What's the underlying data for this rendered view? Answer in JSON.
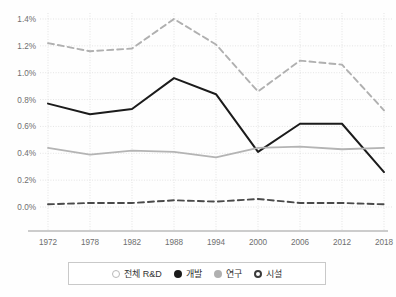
{
  "chart_data": {
    "type": "line",
    "title": "",
    "subtitle": "",
    "xlabel": "",
    "ylabel": "",
    "grid": true,
    "legend_position": "bottom",
    "categories": [
      "1972",
      "1978",
      "1982",
      "1988",
      "1994",
      "2000",
      "2006",
      "2012",
      "2018"
    ],
    "x": [
      1972,
      1978,
      1982,
      1988,
      1994,
      2000,
      2006,
      2012,
      2018
    ],
    "xlim": [
      1972,
      2018
    ],
    "ylim": [
      0.0,
      1.4
    ],
    "y_unit": "%",
    "y_ticks": [
      "0.0%",
      "0.2%",
      "0.4%",
      "0.6%",
      "0.8%",
      "1.0%",
      "1.2%",
      "1.4%"
    ],
    "y_tick_values": [
      0.0,
      0.2,
      0.4,
      0.6,
      0.8,
      1.0,
      1.2,
      1.4
    ],
    "series": [
      {
        "name": "전체 R&D",
        "marker": "open-circle",
        "color": "#b0b0b0",
        "style": "dashed",
        "values": [
          1.22,
          1.16,
          1.18,
          1.4,
          1.21,
          0.86,
          1.09,
          1.06,
          0.72
        ]
      },
      {
        "name": "개발",
        "marker": "filled-circle",
        "color": "#1b1b1b",
        "style": "solid",
        "values": [
          0.77,
          0.69,
          0.73,
          0.96,
          0.84,
          0.41,
          0.62,
          0.62,
          0.26
        ]
      },
      {
        "name": "연구",
        "marker": "gray-circle",
        "color": "#b4b4b4",
        "style": "solid",
        "values": [
          0.44,
          0.39,
          0.42,
          0.41,
          0.37,
          0.44,
          0.45,
          0.43,
          0.44
        ]
      },
      {
        "name": "시설",
        "marker": "bold-open-circle",
        "color": "#4a4a4a",
        "style": "dashed",
        "values": [
          0.02,
          0.03,
          0.03,
          0.05,
          0.04,
          0.06,
          0.03,
          0.03,
          0.02
        ]
      }
    ]
  },
  "legend": {
    "items": [
      {
        "label": "전체 R&D",
        "marker": "open-circle"
      },
      {
        "label": "개발",
        "marker": "filled-circle"
      },
      {
        "label": "연구",
        "marker": "gray-circle"
      },
      {
        "label": "시설",
        "marker": "bold-open-circle"
      }
    ]
  },
  "colors": {
    "total_rd": "#b0b0b0",
    "development": "#1b1b1b",
    "research": "#b4b4b4",
    "facility": "#4a4a4a",
    "grid": "#dddddd",
    "axis": "#9a9a9a",
    "text": "#6f6f6f"
  }
}
